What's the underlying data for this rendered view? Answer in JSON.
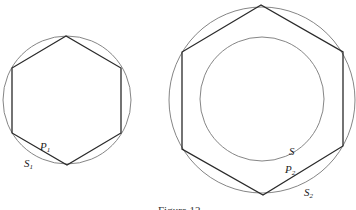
{
  "figure": {
    "caption": "Figure 12",
    "left": {
      "circle": {
        "cx": 67,
        "cy": 100,
        "r": 64
      },
      "hexagon": [
        [
          66,
          36
        ],
        [
          12,
          68
        ],
        [
          12,
          133
        ],
        [
          67,
          165
        ],
        [
          121,
          133
        ],
        [
          121,
          68
        ]
      ],
      "labels": [
        {
          "main": "P",
          "sub": "1",
          "x": 40,
          "y": 150
        },
        {
          "main": "S",
          "sub": "1",
          "x": 24,
          "y": 167
        }
      ]
    },
    "right": {
      "outer_circle": {
        "cx": 262,
        "cy": 100,
        "r": 93
      },
      "inner_circle": {
        "cx": 262,
        "cy": 99,
        "r": 62
      },
      "hexagon": [
        [
          261,
          5
        ],
        [
          182,
          52
        ],
        [
          182,
          149
        ],
        [
          263,
          195
        ],
        [
          343,
          146
        ],
        [
          343,
          52
        ]
      ],
      "labels": [
        {
          "main": "S",
          "sub": "",
          "x": 289,
          "y": 155
        },
        {
          "main": "P",
          "sub": "2",
          "x": 285,
          "y": 173
        },
        {
          "main": "S",
          "sub": "2",
          "x": 304,
          "y": 196
        }
      ]
    },
    "colors": {
      "line": "#2a2a2a",
      "circle": "#777777",
      "background": "#ffffff"
    }
  }
}
